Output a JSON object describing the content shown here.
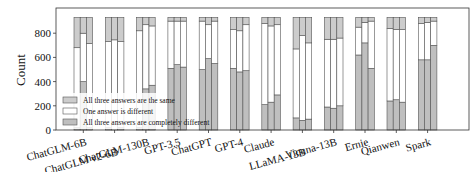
{
  "chart_data": {
    "type": "bar",
    "stacked": true,
    "title": "",
    "xlabel": "",
    "ylabel": "Count",
    "ylim": [
      0,
      950
    ],
    "yticks": [
      0,
      200,
      400,
      600,
      800
    ],
    "grid": false,
    "legend_position": "lower left",
    "categories": [
      "ChatGLM-6B",
      "ChatGLM v2-6B",
      "ChatGLM-130B",
      "GPT-3.5",
      "ChatGPT",
      "GPT-4",
      "Claude",
      "LLaMA-13B",
      "Vicuna-13B",
      "Ernie",
      "Qianwen",
      "Spark"
    ],
    "bars_per_category": 3,
    "total_per_bar": 930,
    "series": [
      {
        "name": "All three answers are completely different",
        "color": "#bfbfbf",
        "values": [
          [
            20,
            400,
            20
          ],
          [
            20,
            0,
            20
          ],
          [
            20,
            340,
            370
          ],
          [
            510,
            540,
            520
          ],
          [
            500,
            590,
            550
          ],
          [
            510,
            480,
            490
          ],
          [
            210,
            230,
            290
          ],
          [
            100,
            80,
            90
          ],
          [
            190,
            180,
            200
          ],
          [
            620,
            720,
            510
          ],
          [
            240,
            250,
            230
          ],
          [
            580,
            580,
            700
          ]
        ]
      },
      {
        "name": "One answer is different",
        "color": "#ffffff",
        "values": [
          [
            660,
            400,
            695
          ],
          [
            710,
            745,
            710
          ],
          [
            800,
            530,
            490
          ],
          [
            390,
            360,
            380
          ],
          [
            400,
            280,
            350
          ],
          [
            320,
            340,
            380
          ],
          [
            670,
            630,
            580
          ],
          [
            570,
            700,
            630
          ],
          [
            560,
            570,
            560
          ],
          [
            230,
            170,
            390
          ],
          [
            600,
            580,
            600
          ],
          [
            300,
            310,
            200
          ]
        ]
      },
      {
        "name": "All three answers are the same",
        "color": "#cccccc",
        "values": [
          [
            250,
            130,
            215
          ],
          [
            200,
            185,
            200
          ],
          [
            110,
            60,
            70
          ],
          [
            30,
            30,
            30
          ],
          [
            30,
            60,
            30
          ],
          [
            100,
            110,
            60
          ],
          [
            50,
            70,
            60
          ],
          [
            260,
            150,
            210
          ],
          [
            180,
            180,
            170
          ],
          [
            80,
            40,
            30
          ],
          [
            90,
            100,
            100
          ],
          [
            50,
            40,
            30
          ]
        ]
      }
    ]
  }
}
